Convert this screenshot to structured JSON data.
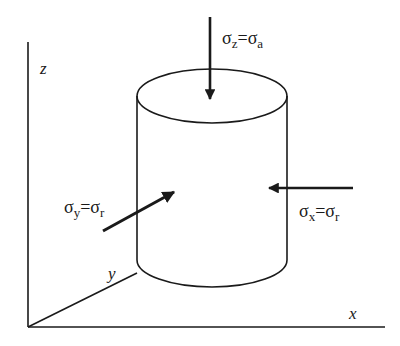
{
  "diagram": {
    "type": "triaxial-stress-cylinder",
    "colors": {
      "stroke": "#1a1a1a",
      "background": "#ffffff"
    },
    "axes": {
      "z": {
        "label": "z"
      },
      "y": {
        "label": "y"
      },
      "x": {
        "label": "x"
      }
    },
    "stresses": {
      "vertical": {
        "sigma": "σ",
        "sub1": "z",
        "eq": "=",
        "sigma2": "σ",
        "sub2": "a",
        "direction": "down"
      },
      "lateral_y": {
        "sigma": "σ",
        "sub1": "y",
        "eq": "=",
        "sigma2": "σ",
        "sub2": "r",
        "direction": "into-page"
      },
      "lateral_x": {
        "sigma": "σ",
        "sub1": "x",
        "eq": "=",
        "sigma2": "σ",
        "sub2": "r",
        "direction": "left"
      }
    }
  }
}
